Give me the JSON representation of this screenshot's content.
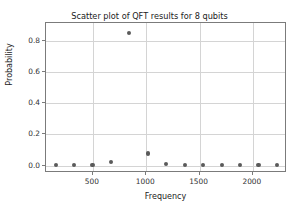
{
  "chart_data": {
    "type": "scatter",
    "title": "Scatter plot of QFT results for 8 qubits",
    "xlabel": "Frequency",
    "ylabel": "Probability",
    "xlim": [
      60,
      2320
    ],
    "ylim": [
      -0.047,
      0.915
    ],
    "xticks": [
      500,
      1000,
      1500,
      2000
    ],
    "xticklabels": [
      "500",
      "1000",
      "1500",
      "2000"
    ],
    "yticks": [
      0.0,
      0.2,
      0.4,
      0.6,
      0.8
    ],
    "yticklabels": [
      "0.0",
      "0.2",
      "0.4",
      "0.6",
      "0.8"
    ],
    "grid": true,
    "legend": false,
    "marker_color": "#5a5a5a",
    "x": [
      150,
      323,
      496,
      669,
      842,
      1015,
      1188,
      1361,
      1534,
      1707,
      1880,
      2053,
      2226
    ],
    "y": [
      0.004,
      0.005,
      0.006,
      0.022,
      0.85,
      0.078,
      0.011,
      0.005,
      0.004,
      0.003,
      0.003,
      0.003,
      0.002
    ],
    "points": [
      {
        "x": 150,
        "y": 0.004
      },
      {
        "x": 323,
        "y": 0.005
      },
      {
        "x": 496,
        "y": 0.006
      },
      {
        "x": 669,
        "y": 0.022
      },
      {
        "x": 842,
        "y": 0.85
      },
      {
        "x": 1015,
        "y": 0.078
      },
      {
        "x": 1188,
        "y": 0.011
      },
      {
        "x": 1361,
        "y": 0.005
      },
      {
        "x": 1534,
        "y": 0.004
      },
      {
        "x": 1707,
        "y": 0.003
      },
      {
        "x": 1880,
        "y": 0.003
      },
      {
        "x": 2053,
        "y": 0.003
      },
      {
        "x": 2226,
        "y": 0.002
      }
    ]
  }
}
